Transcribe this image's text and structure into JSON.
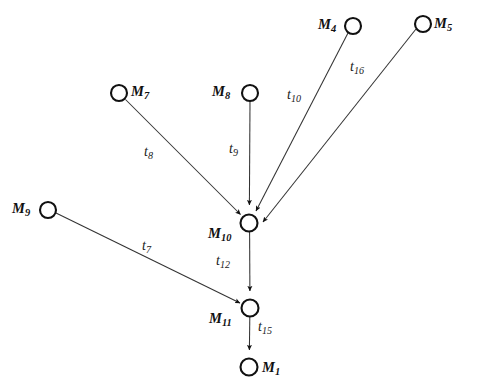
{
  "diagram": {
    "type": "directed-graph",
    "title": "",
    "width": 477,
    "height": 388,
    "colors": {
      "background": "#ffffff",
      "node_stroke": "#111111",
      "node_fill": "#ffffff",
      "edge_stroke": "#333333",
      "text": "#111111"
    },
    "nodes": [
      {
        "id": "M4",
        "label": "M",
        "sub": "4",
        "cx": 353,
        "cy": 26,
        "r": 8,
        "label_x": 318,
        "label_y": 17,
        "label_side": "left"
      },
      {
        "id": "M5",
        "label": "M",
        "sub": "5",
        "cx": 423,
        "cy": 24,
        "r": 8,
        "label_x": 434,
        "label_y": 16,
        "label_side": "right"
      },
      {
        "id": "M7",
        "label": "M",
        "sub": "7",
        "cx": 119,
        "cy": 93,
        "r": 8,
        "label_x": 131,
        "label_y": 84,
        "label_side": "right"
      },
      {
        "id": "M8",
        "label": "M",
        "sub": "8",
        "cx": 250,
        "cy": 93,
        "r": 8,
        "label_x": 212,
        "label_y": 84,
        "label_side": "left"
      },
      {
        "id": "M9",
        "label": "M",
        "sub": "9",
        "cx": 48,
        "cy": 210,
        "r": 8,
        "label_x": 12,
        "label_y": 201,
        "label_side": "left"
      },
      {
        "id": "M10",
        "label": "M",
        "sub": "10",
        "cx": 249,
        "cy": 223,
        "r": 8.5,
        "label_x": 208,
        "label_y": 226,
        "label_side": "left"
      },
      {
        "id": "M11",
        "label": "M",
        "sub": "11",
        "cx": 250,
        "cy": 308,
        "r": 8.5,
        "label_x": 209,
        "label_y": 311,
        "label_side": "left"
      },
      {
        "id": "M1",
        "label": "M",
        "sub": "1",
        "cx": 249,
        "cy": 367,
        "r": 8.5,
        "label_x": 262,
        "label_y": 360,
        "label_side": "right"
      }
    ],
    "edges": [
      {
        "id": "t8",
        "label": "t",
        "sub": "8",
        "from": "M7",
        "to": "M10",
        "label_x": 144,
        "label_y": 145
      },
      {
        "id": "t9",
        "label": "t",
        "sub": "9",
        "from": "M8",
        "to": "M10",
        "label_x": 229,
        "label_y": 142
      },
      {
        "id": "t10",
        "label": "t",
        "sub": "10",
        "from": "M4",
        "to": "M10",
        "label_x": 287,
        "label_y": 88
      },
      {
        "id": "t16",
        "label": "t",
        "sub": "16",
        "from": "M5",
        "to": "M10",
        "label_x": 350,
        "label_y": 60
      },
      {
        "id": "t7",
        "label": "t",
        "sub": "7",
        "from": "M9",
        "to": "M11",
        "label_x": 142,
        "label_y": 239
      },
      {
        "id": "t12",
        "label": "t",
        "sub": "12",
        "from": "M10",
        "to": "M11",
        "label_x": 216,
        "label_y": 254
      },
      {
        "id": "t15",
        "label": "t",
        "sub": "15",
        "from": "M11",
        "to": "M1",
        "label_x": 258,
        "label_y": 320
      }
    ]
  }
}
